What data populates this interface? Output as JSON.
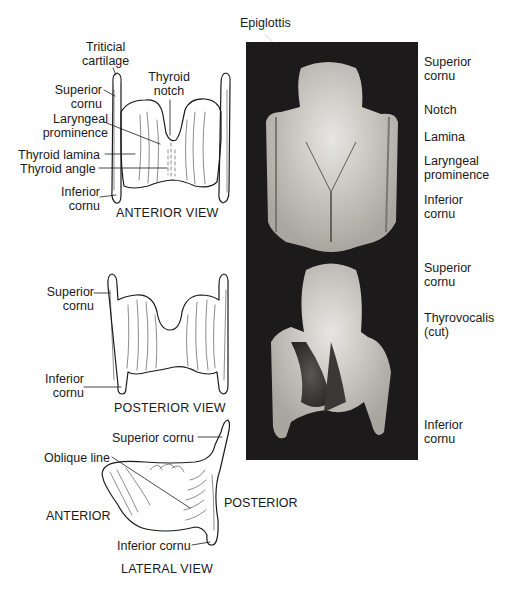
{
  "figure": {
    "anterior_view": {
      "title": "ANTERIOR VIEW",
      "labels": {
        "triticial": [
          "Triticial",
          "cartilage"
        ],
        "superior_cornu": [
          "Superior",
          "cornu"
        ],
        "thyroid_notch": [
          "Thyroid",
          "notch"
        ],
        "laryngeal_prominence": [
          "Laryngeal",
          "prominence"
        ],
        "thyroid_lamina": "Thyroid lamina",
        "thyroid_angle": "Thyroid angle",
        "inferior_cornu": [
          "Inferior",
          "cornu"
        ]
      }
    },
    "posterior_view": {
      "title": "POSTERIOR VIEW",
      "labels": {
        "superior_cornu": [
          "Superior",
          "cornu"
        ],
        "inferior_cornu": [
          "Inferior",
          "cornu"
        ]
      }
    },
    "lateral_view": {
      "title": "LATERAL VIEW",
      "labels": {
        "superior_cornu": "Superior cornu",
        "oblique_line": "Oblique line",
        "anterior": "ANTERIOR",
        "posterior": "POSTERIOR",
        "inferior_cornu": "Inferior cornu"
      }
    },
    "photo_anterior": {
      "labels": {
        "epiglottis": "Epiglottis",
        "superior_cornu": [
          "Superior",
          "cornu"
        ],
        "notch": "Notch",
        "lamina": "Lamina",
        "laryngeal_prominence": [
          "Laryngeal",
          "prominence"
        ],
        "inferior_cornu": [
          "Inferior",
          "cornu"
        ]
      }
    },
    "photo_posterior": {
      "labels": {
        "superior_cornu": [
          "Superior",
          "cornu"
        ],
        "thyrovocalis": [
          "Thyrovocalis",
          "(cut)"
        ],
        "inferior_cornu": [
          "Inferior",
          "cornu"
        ]
      }
    }
  }
}
